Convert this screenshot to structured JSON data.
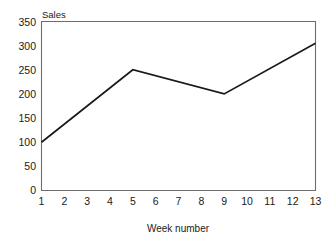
{
  "chart_data": {
    "type": "line",
    "title": "",
    "xlabel": "Week number",
    "ylabel": "Sales",
    "x": [
      1,
      2,
      3,
      4,
      5,
      6,
      7,
      8,
      9,
      10,
      11,
      12,
      13
    ],
    "values": [
      100,
      137,
      175,
      212,
      250,
      238,
      225,
      212,
      200,
      226,
      252,
      278,
      305
    ],
    "vertices": [
      {
        "x": 1,
        "y": 100
      },
      {
        "x": 5,
        "y": 250
      },
      {
        "x": 9,
        "y": 200
      },
      {
        "x": 13,
        "y": 305
      }
    ],
    "xlim": [
      1,
      13
    ],
    "ylim": [
      0,
      350
    ],
    "ytick_labels": [
      "350",
      "300",
      "250",
      "200",
      "150",
      "100",
      "50",
      "0"
    ],
    "ytick_values": [
      350,
      300,
      250,
      200,
      150,
      100,
      50,
      0
    ],
    "xtick_labels": [
      "1",
      "2",
      "3",
      "4",
      "5",
      "6",
      "7",
      "8",
      "9",
      "10",
      "11",
      "12",
      "13"
    ],
    "grid": false,
    "legend": false,
    "markers": false,
    "series": [
      {
        "name": "Sales",
        "values": [
          100,
          137,
          175,
          212,
          250,
          238,
          225,
          212,
          200,
          226,
          252,
          278,
          305
        ]
      }
    ],
    "colors": {
      "line": "#1a1a1a",
      "frame": "#6e6e6e",
      "text": "#1a1a1a",
      "background": "#ffffff"
    }
  }
}
